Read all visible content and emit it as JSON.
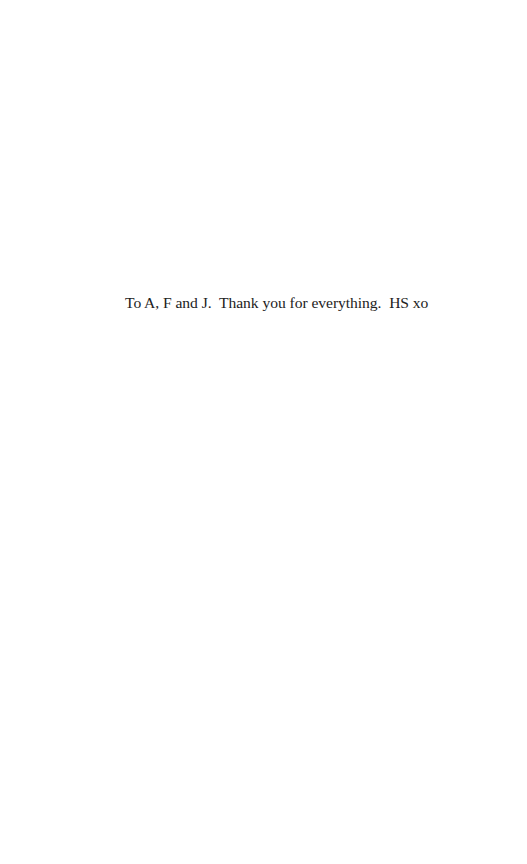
{
  "page": {
    "type": "dedication",
    "dedication_text": "To A, F and J.  Thank you for everything.  HS xo"
  }
}
